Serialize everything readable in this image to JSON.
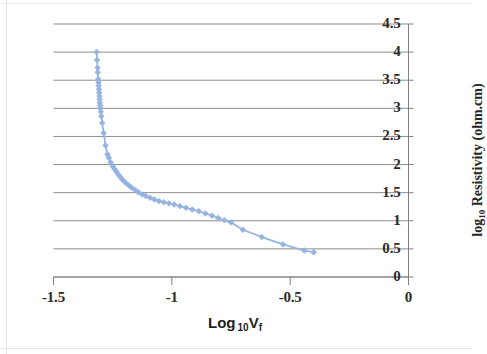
{
  "chart_data": {
    "type": "line",
    "title": "",
    "xlabel": "Log 10Vf",
    "ylabel": "log10 Resistivity (ohm.cm)",
    "xlabel_parts": {
      "main": "Log",
      "sub": "10",
      "var": "V",
      "varsub": "f"
    },
    "ylabel_parts": {
      "main": "log",
      "sub": "10",
      "rest": " Resistivity (ohm.cm)"
    },
    "xlim": [
      -1.5,
      0
    ],
    "ylim": [
      0,
      4.5
    ],
    "xticks": [
      "-1.5",
      "-1",
      "-0.5",
      "0"
    ],
    "xtick_values": [
      -1.5,
      -1,
      -0.5,
      0
    ],
    "yticks": [
      "0",
      "0.5",
      "1",
      "1.5",
      "2",
      "2.5",
      "3",
      "3.5",
      "4",
      "4.5"
    ],
    "ytick_values": [
      0,
      0.5,
      1,
      1.5,
      2,
      2.5,
      3,
      3.5,
      4,
      4.5
    ],
    "grid": "horizontal",
    "legend": "none",
    "y_axis_position": "right",
    "series": [
      {
        "name": "Resistivity vs Log10 Vf",
        "color": "#95b3e0",
        "marker": "diamond",
        "points": [
          [
            -1.318,
            4.0
          ],
          [
            -1.316,
            3.86
          ],
          [
            -1.314,
            3.72
          ],
          [
            -1.313,
            3.64
          ],
          [
            -1.311,
            3.52
          ],
          [
            -1.31,
            3.46
          ],
          [
            -1.309,
            3.4
          ],
          [
            -1.308,
            3.34
          ],
          [
            -1.307,
            3.28
          ],
          [
            -1.306,
            3.22
          ],
          [
            -1.305,
            3.16
          ],
          [
            -1.304,
            3.1
          ],
          [
            -1.303,
            3.05
          ],
          [
            -1.302,
            3.0
          ],
          [
            -1.3,
            2.94
          ],
          [
            -1.298,
            2.86
          ],
          [
            -1.294,
            2.74
          ],
          [
            -1.288,
            2.56
          ],
          [
            -1.28,
            2.34
          ],
          [
            -1.272,
            2.18
          ],
          [
            -1.266,
            2.12
          ],
          [
            -1.258,
            2.04
          ],
          [
            -1.25,
            1.97
          ],
          [
            -1.242,
            1.92
          ],
          [
            -1.234,
            1.87
          ],
          [
            -1.226,
            1.82
          ],
          [
            -1.216,
            1.77
          ],
          [
            -1.206,
            1.72
          ],
          [
            -1.194,
            1.67
          ],
          [
            -1.182,
            1.63
          ],
          [
            -1.17,
            1.59
          ],
          [
            -1.156,
            1.55
          ],
          [
            -1.142,
            1.51
          ],
          [
            -1.126,
            1.47
          ],
          [
            -1.11,
            1.44
          ],
          [
            -1.092,
            1.41
          ],
          [
            -1.074,
            1.38
          ],
          [
            -1.054,
            1.35
          ],
          [
            -1.034,
            1.33
          ],
          [
            -1.012,
            1.31
          ],
          [
            -0.99,
            1.29
          ],
          [
            -0.966,
            1.26
          ],
          [
            -0.94,
            1.23
          ],
          [
            -0.914,
            1.2
          ],
          [
            -0.886,
            1.17
          ],
          [
            -0.858,
            1.13
          ],
          [
            -0.83,
            1.09
          ],
          [
            -0.804,
            1.05
          ],
          [
            -0.778,
            1.01
          ],
          [
            -0.75,
            0.97
          ],
          [
            -0.7,
            0.84
          ],
          [
            -0.62,
            0.71
          ],
          [
            -0.53,
            0.58
          ],
          [
            -0.44,
            0.47
          ],
          [
            -0.4,
            0.44
          ]
        ]
      }
    ]
  },
  "axes": {
    "grid_color": "#808080",
    "axis_color": "#808080",
    "text_color": "#262626"
  }
}
